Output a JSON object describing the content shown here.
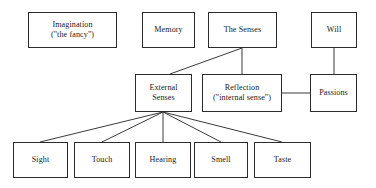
{
  "diagram": {
    "style": {
      "background": "#ffffff",
      "box_border_color": "#2b2b2b",
      "connector_color": "#3a3a3a",
      "text_color": "#1a1a1a"
    },
    "nodes": [
      {
        "id": "imagination",
        "label": "Imagination",
        "sublabel": "(\"the fancy\")",
        "x": 28,
        "y": 12,
        "w": 89,
        "h": 36
      },
      {
        "id": "memory",
        "label": "Memory",
        "sublabel": "",
        "x": 142,
        "y": 12,
        "w": 53,
        "h": 36
      },
      {
        "id": "the-senses",
        "label": "The Senses",
        "sublabel": "",
        "x": 208,
        "y": 12,
        "w": 69,
        "h": 36
      },
      {
        "id": "will",
        "label": "Will",
        "sublabel": "",
        "x": 311,
        "y": 12,
        "w": 46,
        "h": 36
      },
      {
        "id": "external-senses",
        "label": "External",
        "sublabel": "Senses",
        "x": 135,
        "y": 74,
        "w": 57,
        "h": 38
      },
      {
        "id": "reflection",
        "label": "Reflection",
        "sublabel": "(\"internal sense\")",
        "x": 202,
        "y": 74,
        "w": 80,
        "h": 38
      },
      {
        "id": "passions",
        "label": "Passions",
        "sublabel": "",
        "x": 310,
        "y": 74,
        "w": 47,
        "h": 38
      },
      {
        "id": "sight",
        "label": "Sight",
        "sublabel": "",
        "x": 13,
        "y": 142,
        "w": 55,
        "h": 36
      },
      {
        "id": "touch",
        "label": "Touch",
        "sublabel": "",
        "x": 74,
        "y": 142,
        "w": 56,
        "h": 36
      },
      {
        "id": "hearing",
        "label": "Hearing",
        "sublabel": "",
        "x": 135,
        "y": 142,
        "w": 56,
        "h": 36
      },
      {
        "id": "smell",
        "label": "Smell",
        "sublabel": "",
        "x": 194,
        "y": 142,
        "w": 54,
        "h": 36
      },
      {
        "id": "taste",
        "label": "Taste",
        "sublabel": "",
        "x": 254,
        "y": 142,
        "w": 57,
        "h": 36
      }
    ],
    "connectors": [
      {
        "id": "senses-to-external",
        "from": "the-senses",
        "to": "external-senses",
        "x1": 242,
        "y1": 48,
        "x2": 170,
        "y2": 74
      },
      {
        "id": "senses-to-reflection",
        "from": "the-senses",
        "to": "reflection",
        "x1": 242,
        "y1": 48,
        "x2": 242,
        "y2": 74
      },
      {
        "id": "will-to-passions",
        "from": "will",
        "to": "passions",
        "x1": 334,
        "y1": 48,
        "x2": 334,
        "y2": 74
      },
      {
        "id": "reflection-to-passions",
        "from": "reflection",
        "to": "passions",
        "x1": 282,
        "y1": 93,
        "x2": 310,
        "y2": 93
      },
      {
        "id": "external-to-sight",
        "from": "external-senses",
        "to": "sight",
        "x1": 163,
        "y1": 112,
        "x2": 40,
        "y2": 142
      },
      {
        "id": "external-to-touch",
        "from": "external-senses",
        "to": "touch",
        "x1": 163,
        "y1": 112,
        "x2": 102,
        "y2": 142
      },
      {
        "id": "external-to-hearing",
        "from": "external-senses",
        "to": "hearing",
        "x1": 163,
        "y1": 112,
        "x2": 163,
        "y2": 142
      },
      {
        "id": "external-to-smell",
        "from": "external-senses",
        "to": "smell",
        "x1": 163,
        "y1": 112,
        "x2": 221,
        "y2": 142
      },
      {
        "id": "external-to-taste",
        "from": "external-senses",
        "to": "taste",
        "x1": 163,
        "y1": 112,
        "x2": 282,
        "y2": 142
      }
    ]
  }
}
